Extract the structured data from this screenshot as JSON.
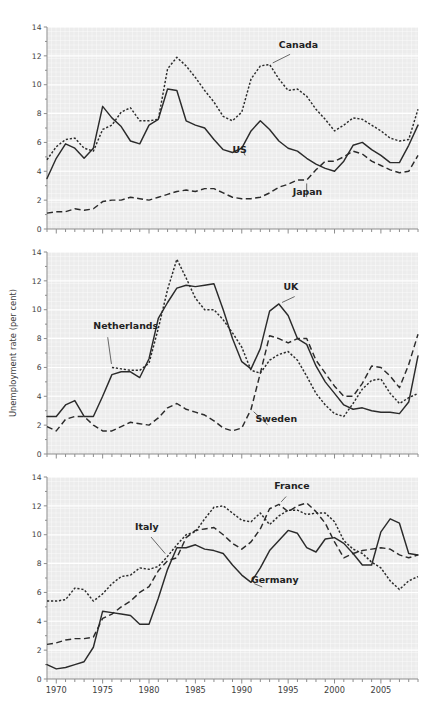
{
  "figure": {
    "ylabel": "Unemployment rate (per cent)",
    "y_ticks": [
      0,
      2,
      4,
      6,
      8,
      10,
      12,
      14
    ],
    "x_ticks": [
      1970,
      1975,
      1980,
      1985,
      1990,
      1995,
      2000,
      2005
    ],
    "xlim": [
      1969,
      2009
    ],
    "ylim": [
      0,
      14
    ],
    "panel_bg": "#ececec",
    "line_color": "#2b2b2b",
    "grid_color": "#ffffff"
  },
  "chart_data": [
    {
      "type": "line",
      "panel": 1,
      "title": "",
      "xlabel": "",
      "ylabel": "Unemployment rate (per cent)",
      "xlim": [
        1969,
        2009
      ],
      "ylim": [
        0,
        14
      ],
      "grid": true,
      "legend_position": "inline-labels",
      "x": [
        1969,
        1970,
        1971,
        1972,
        1973,
        1974,
        1975,
        1976,
        1977,
        1978,
        1979,
        1980,
        1981,
        1982,
        1983,
        1984,
        1985,
        1986,
        1987,
        1988,
        1989,
        1990,
        1991,
        1992,
        1993,
        1994,
        1995,
        1996,
        1997,
        1998,
        1999,
        2000,
        2001,
        2002,
        2003,
        2004,
        2005,
        2006,
        2007,
        2008,
        2009
      ],
      "series": [
        {
          "name": "Canada",
          "style": "dotted",
          "label_x": 1995.5,
          "label_y": 12.2,
          "values": [
            4.8,
            5.7,
            6.2,
            6.3,
            5.6,
            5.4,
            6.9,
            7.2,
            8.1,
            8.4,
            7.5,
            7.5,
            7.6,
            11.1,
            11.9,
            11.3,
            10.5,
            9.6,
            8.8,
            7.8,
            7.5,
            8.1,
            10.4,
            11.3,
            11.4,
            10.4,
            9.6,
            9.7,
            9.2,
            8.3,
            7.6,
            6.8,
            7.2,
            7.7,
            7.6,
            7.2,
            6.8,
            6.3,
            6.1,
            6.2,
            8.3
          ]
        },
        {
          "name": "US",
          "style": "solid",
          "label_x": 1990.5,
          "label_y": 4.9,
          "values": [
            3.5,
            4.9,
            5.9,
            5.6,
            4.9,
            5.6,
            8.5,
            7.7,
            7.1,
            6.1,
            5.9,
            7.2,
            7.6,
            9.7,
            9.6,
            7.5,
            7.2,
            7.0,
            6.2,
            5.5,
            5.3,
            5.6,
            6.8,
            7.5,
            6.9,
            6.1,
            5.6,
            5.4,
            4.9,
            4.5,
            4.2,
            4.0,
            4.7,
            5.8,
            6.0,
            5.5,
            5.1,
            4.6,
            4.6,
            5.8,
            7.2
          ]
        },
        {
          "name": "Japan",
          "style": "dashed",
          "label_x": 1997.0,
          "label_y": 2.0,
          "values": [
            1.1,
            1.2,
            1.2,
            1.4,
            1.3,
            1.4,
            1.9,
            2.0,
            2.0,
            2.2,
            2.1,
            2.0,
            2.2,
            2.4,
            2.6,
            2.7,
            2.6,
            2.8,
            2.8,
            2.5,
            2.2,
            2.1,
            2.1,
            2.2,
            2.5,
            2.9,
            3.1,
            3.4,
            3.4,
            4.1,
            4.7,
            4.7,
            5.0,
            5.4,
            5.2,
            4.7,
            4.4,
            4.1,
            3.9,
            4.0,
            5.1
          ]
        }
      ]
    },
    {
      "type": "line",
      "panel": 2,
      "title": "",
      "xlabel": "",
      "ylabel": "Unemployment rate (per cent)",
      "xlim": [
        1969,
        2009
      ],
      "ylim": [
        0,
        14
      ],
      "grid": true,
      "legend_position": "inline-labels",
      "x": [
        1969,
        1970,
        1971,
        1972,
        1973,
        1974,
        1975,
        1976,
        1977,
        1978,
        1979,
        1980,
        1981,
        1982,
        1983,
        1984,
        1985,
        1986,
        1987,
        1988,
        1989,
        1990,
        1991,
        1992,
        1993,
        1994,
        1995,
        1996,
        1997,
        1998,
        1999,
        2000,
        2001,
        2002,
        2003,
        2004,
        2005,
        2006,
        2007,
        2008,
        2009
      ],
      "series": [
        {
          "name": "UK",
          "style": "solid",
          "label_x": 1996.0,
          "label_y": 11.0,
          "values": [
            2.6,
            2.6,
            3.4,
            3.7,
            2.6,
            2.6,
            4.0,
            5.5,
            5.7,
            5.7,
            5.3,
            6.6,
            9.4,
            10.5,
            11.5,
            11.7,
            11.6,
            11.7,
            11.8,
            10.0,
            8.0,
            6.4,
            5.9,
            7.3,
            9.9,
            10.4,
            9.6,
            8.0,
            7.6,
            6.1,
            5.0,
            4.2,
            3.4,
            3.1,
            3.2,
            3.0,
            2.9,
            2.9,
            2.8,
            3.6,
            6.8
          ]
        },
        {
          "name": "Netherlands",
          "style": "dotted",
          "label_x": 1975.5,
          "label_y": 8.3,
          "values": [
            null,
            null,
            null,
            null,
            null,
            null,
            null,
            6.0,
            5.9,
            5.8,
            5.8,
            6.3,
            8.7,
            11.4,
            13.5,
            12.2,
            10.8,
            10.0,
            10.0,
            9.3,
            8.4,
            7.4,
            5.8,
            5.6,
            6.5,
            6.9,
            7.1,
            6.5,
            5.4,
            4.2,
            3.4,
            2.8,
            2.6,
            3.5,
            4.5,
            5.1,
            5.2,
            4.2,
            3.5,
            3.9,
            4.2
          ]
        },
        {
          "name": "Sweden",
          "style": "dashed",
          "label_x": 1993.0,
          "label_y": 1.9,
          "values": [
            1.9,
            1.6,
            2.4,
            2.6,
            2.6,
            2.0,
            1.6,
            1.6,
            1.9,
            2.2,
            2.1,
            2.0,
            2.5,
            3.2,
            3.5,
            3.1,
            2.9,
            2.7,
            2.3,
            1.8,
            1.6,
            1.8,
            3.1,
            5.6,
            8.2,
            8.0,
            7.7,
            8.0,
            8.0,
            6.5,
            5.6,
            4.7,
            4.0,
            4.0,
            4.9,
            6.1,
            6.0,
            5.4,
            4.6,
            6.2,
            8.3
          ]
        }
      ]
    },
    {
      "type": "line",
      "panel": 3,
      "title": "",
      "xlabel": "",
      "ylabel": "Unemployment rate (per cent)",
      "xlim": [
        1969,
        2009
      ],
      "ylim": [
        0,
        14
      ],
      "grid": true,
      "legend_position": "inline-labels",
      "x": [
        1969,
        1970,
        1971,
        1972,
        1973,
        1974,
        1975,
        1976,
        1977,
        1978,
        1979,
        1980,
        1981,
        1982,
        1983,
        1984,
        1985,
        1986,
        1987,
        1988,
        1989,
        1990,
        1991,
        1992,
        1993,
        1994,
        1995,
        1996,
        1997,
        1998,
        1999,
        2000,
        2001,
        2002,
        2003,
        2004,
        2005,
        2006,
        2007,
        2008,
        2009
      ],
      "series": [
        {
          "name": "Italy",
          "style": "dotted",
          "label_x": 1980.0,
          "label_y": 10.0,
          "values": [
            5.4,
            5.4,
            5.5,
            6.3,
            6.2,
            5.4,
            5.9,
            6.6,
            7.1,
            7.2,
            7.7,
            7.6,
            7.8,
            8.5,
            9.3,
            10.0,
            10.2,
            11.1,
            11.9,
            12.0,
            11.5,
            11.0,
            10.9,
            11.5,
            10.7,
            11.3,
            11.7,
            11.7,
            11.4,
            11.5,
            11.5,
            10.9,
            9.6,
            9.0,
            8.7,
            8.1,
            7.7,
            6.8,
            6.2,
            6.8,
            7.1
          ]
        },
        {
          "name": "France",
          "style": "dashed",
          "label_x": 1995.0,
          "label_y": 12.8,
          "values": [
            2.4,
            2.5,
            2.7,
            2.8,
            2.8,
            2.9,
            4.2,
            4.5,
            5.0,
            5.4,
            6.0,
            6.4,
            7.5,
            8.2,
            8.4,
            9.8,
            10.3,
            10.4,
            10.5,
            10.0,
            9.4,
            9.0,
            9.5,
            10.4,
            11.8,
            12.1,
            11.6,
            12.0,
            12.2,
            11.6,
            10.8,
            9.5,
            8.4,
            8.7,
            8.9,
            9.0,
            9.1,
            9.0,
            8.6,
            8.4,
            8.6
          ]
        },
        {
          "name": "Germany",
          "style": "solid",
          "label_x": 1992.5,
          "label_y": 6.3,
          "values": [
            1.0,
            0.7,
            0.8,
            1.0,
            1.2,
            2.2,
            4.7,
            4.6,
            4.5,
            4.4,
            3.8,
            3.8,
            5.6,
            7.6,
            9.1,
            9.1,
            9.3,
            9.0,
            8.9,
            8.7,
            7.9,
            7.2,
            6.7,
            7.7,
            8.9,
            9.6,
            10.3,
            10.1,
            9.1,
            8.8,
            9.7,
            9.8,
            9.4,
            8.7,
            7.9,
            7.9,
            10.2,
            11.1,
            10.8,
            8.7,
            8.6
          ]
        }
      ]
    }
  ]
}
